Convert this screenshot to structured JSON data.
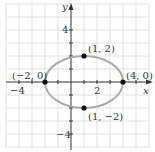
{
  "diagram": {
    "type": "ellipse-graph",
    "axes": {
      "x_label": "x",
      "y_label": "y",
      "x_ticks": [
        {
          "value": -4,
          "label": "−4"
        },
        {
          "value": 2,
          "label": "2"
        }
      ],
      "y_ticks": [
        {
          "value": 4,
          "label": "4"
        },
        {
          "value": -4,
          "label": "−4"
        }
      ],
      "grid_unit": 1,
      "x_range": [
        -5,
        6
      ],
      "y_range": [
        -5,
        6
      ]
    },
    "ellipse": {
      "center": [
        1,
        0
      ],
      "semi_major_x": 3,
      "semi_minor_y": 2,
      "color": "#aaaaaa"
    },
    "points": [
      {
        "coords": [
          1,
          2
        ],
        "label": "(1, 2)"
      },
      {
        "coords": [
          -2,
          0
        ],
        "label": "(−2, 0)"
      },
      {
        "coords": [
          4,
          0
        ],
        "label": "(4, 0)"
      },
      {
        "coords": [
          1,
          -2
        ],
        "label": "(1, −2)"
      }
    ]
  }
}
